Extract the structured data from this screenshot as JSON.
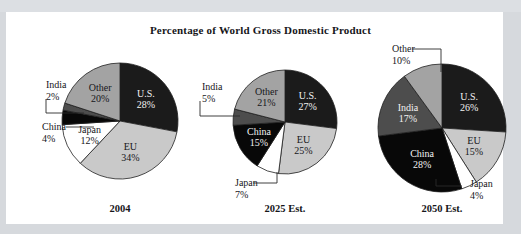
{
  "page": {
    "background_color": "#d6d9dd",
    "paper_color": "#ffffff",
    "top_band_text": ""
  },
  "title": "Percentage of World Gross Domestic Product",
  "palette": {
    "us": "#1b1b1b",
    "eu": "#c9c9c9",
    "japan": "#ffffff",
    "china": "#080808",
    "india": "#4d4d4d",
    "other": "#a3a3a3",
    "outline": "#1f1f1f",
    "text_dark": "#16161a",
    "text_light": "#f2f2f2",
    "leader": "#2b2b2b"
  },
  "chart_data": {
    "type": "pie",
    "title": "Percentage of World Gross Domestic Product",
    "xlabel": "",
    "ylabel": "",
    "legend_position": "none",
    "grid": false,
    "value_unit": "percent",
    "categories": [
      "U.S.",
      "EU",
      "Japan",
      "China",
      "India",
      "Other"
    ],
    "charts": [
      {
        "caption": "2004",
        "center": [
          120,
          121
        ],
        "radius": 58,
        "start_angle_deg": -90,
        "slices": [
          {
            "name": "U.S.",
            "value": 28,
            "label": "U.S.",
            "value_label": "28%",
            "color": "#1b1b1b",
            "label_placement": "inside",
            "text_color": "light"
          },
          {
            "name": "EU",
            "value": 34,
            "label": "EU",
            "value_label": "34%",
            "color": "#c9c9c9",
            "label_placement": "inside",
            "text_color": "dark"
          },
          {
            "name": "Japan",
            "value": 12,
            "label": "Japan",
            "value_label": "12%",
            "color": "#ffffff",
            "label_placement": "inside",
            "text_color": "dark"
          },
          {
            "name": "China",
            "value": 4,
            "label": "China",
            "value_label": "4%",
            "color": "#080808",
            "label_placement": "outside-left",
            "text_color": "dark"
          },
          {
            "name": "India",
            "value": 2,
            "label": "India",
            "value_label": "2%",
            "color": "#4d4d4d",
            "label_placement": "outside-left",
            "text_color": "dark"
          },
          {
            "name": "Other",
            "value": 20,
            "label": "Other",
            "value_label": "20%",
            "color": "#a3a3a3",
            "label_placement": "inside",
            "text_color": "dark"
          }
        ]
      },
      {
        "caption": "2025 Est.",
        "center": [
          285,
          122
        ],
        "radius": 52,
        "start_angle_deg": -90,
        "slices": [
          {
            "name": "U.S.",
            "value": 27,
            "label": "U.S.",
            "value_label": "27%",
            "color": "#1b1b1b",
            "label_placement": "inside",
            "text_color": "light"
          },
          {
            "name": "EU",
            "value": 25,
            "label": "EU",
            "value_label": "25%",
            "color": "#c9c9c9",
            "label_placement": "inside",
            "text_color": "dark"
          },
          {
            "name": "Japan",
            "value": 7,
            "label": "Japan",
            "value_label": "7%",
            "color": "#ffffff",
            "label_placement": "outside-bottom-left",
            "text_color": "dark"
          },
          {
            "name": "China",
            "value": 15,
            "label": "China",
            "value_label": "15%",
            "color": "#080808",
            "label_placement": "inside",
            "text_color": "light"
          },
          {
            "name": "India",
            "value": 5,
            "label": "India",
            "value_label": "5%",
            "color": "#4d4d4d",
            "label_placement": "outside-left",
            "text_color": "dark"
          },
          {
            "name": "Other",
            "value": 21,
            "label": "Other",
            "value_label": "21%",
            "color": "#a3a3a3",
            "label_placement": "inside",
            "text_color": "dark"
          }
        ]
      },
      {
        "caption": "2050 Est.",
        "center": [
          442,
          128
        ],
        "radius": 64,
        "start_angle_deg": -90,
        "slices": [
          {
            "name": "U.S.",
            "value": 26,
            "label": "U.S.",
            "value_label": "26%",
            "color": "#1b1b1b",
            "label_placement": "inside",
            "text_color": "light"
          },
          {
            "name": "EU",
            "value": 15,
            "label": "EU",
            "value_label": "15%",
            "color": "#c9c9c9",
            "label_placement": "inside",
            "text_color": "dark"
          },
          {
            "name": "Japan",
            "value": 4,
            "label": "Japan",
            "value_label": "4%",
            "color": "#ffffff",
            "label_placement": "outside-bottom-right",
            "text_color": "dark"
          },
          {
            "name": "China",
            "value": 28,
            "label": "China",
            "value_label": "28%",
            "color": "#080808",
            "label_placement": "inside",
            "text_color": "light"
          },
          {
            "name": "India",
            "value": 17,
            "label": "India",
            "value_label": "17%",
            "color": "#4d4d4d",
            "label_placement": "inside",
            "text_color": "light"
          },
          {
            "name": "Other",
            "value": 10,
            "label": "Other",
            "value_label": "10%",
            "color": "#a3a3a3",
            "label_placement": "outside-top-left",
            "text_color": "dark"
          }
        ]
      }
    ]
  },
  "captions": {
    "pie1": "2004",
    "pie2": "2025 Est.",
    "pie3": "2050 Est."
  },
  "callouts": {
    "pie1": {
      "india": {
        "label": "India",
        "value_label": "2%",
        "text_x": 46,
        "text_y": 88,
        "line": "M 46 99 L 46 113 L 84 113"
      },
      "china": {
        "label": "China",
        "value_label": "4%",
        "text_x": 42,
        "text_y": 130,
        "line": "M 66 127 L 94 127"
      }
    },
    "pie2": {
      "india": {
        "label": "India",
        "value_label": "5%",
        "text_x": 202,
        "text_y": 90,
        "line": "M 200 101 L 200 116 L 240 116"
      },
      "japan": {
        "label": "Japan",
        "value_label": "7%",
        "text_x": 235,
        "text_y": 186,
        "line": "M 253 183 L 277 183 L 277 172"
      }
    },
    "pie3": {
      "other": {
        "label": "Other",
        "value_label": "10%",
        "text_x": 392,
        "text_y": 52,
        "line": "M 412 49 L 441 49 L 441 72"
      },
      "japan": {
        "label": "Japan",
        "value_label": "4%",
        "text_x": 470,
        "text_y": 187,
        "line": "M 436 179 L 436 186 L 462 186"
      }
    }
  }
}
